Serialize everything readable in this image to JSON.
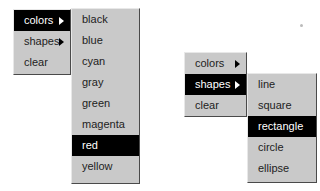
{
  "left_example": {
    "main_menu": {
      "items": [
        {
          "label": "colors",
          "has_submenu": true,
          "selected": true
        },
        {
          "label": "shapes",
          "has_submenu": true,
          "selected": false
        },
        {
          "label": "clear",
          "has_submenu": false,
          "selected": false
        }
      ]
    },
    "submenu": {
      "items": [
        {
          "label": "black"
        },
        {
          "label": "blue"
        },
        {
          "label": "cyan"
        },
        {
          "label": "gray"
        },
        {
          "label": "green"
        },
        {
          "label": "magenta"
        },
        {
          "label": "red",
          "selected": true
        },
        {
          "label": "yellow"
        }
      ]
    }
  },
  "right_example": {
    "main_menu": {
      "items": [
        {
          "label": "colors",
          "has_submenu": true,
          "selected": false
        },
        {
          "label": "shapes",
          "has_submenu": true,
          "selected": true
        },
        {
          "label": "clear",
          "has_submenu": false,
          "selected": false
        }
      ]
    },
    "submenu": {
      "items": [
        {
          "label": "line"
        },
        {
          "label": "square"
        },
        {
          "label": "rectangle",
          "selected": true
        },
        {
          "label": "circle"
        },
        {
          "label": "ellipse"
        }
      ]
    }
  },
  "colors": {
    "menu_bg": "#c9c9c9",
    "highlight_bg": "#000000",
    "highlight_text": "#ffffff",
    "text": "#222222"
  }
}
